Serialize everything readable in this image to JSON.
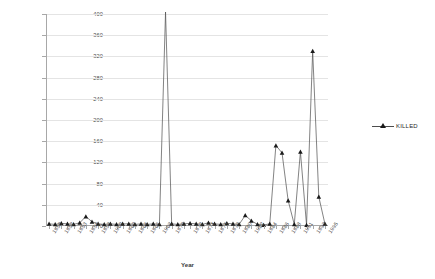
{
  "chart_data": {
    "type": "line",
    "title": "",
    "xlabel": "Year",
    "ylabel": "Killed",
    "ylim": [
      0,
      400
    ],
    "ytick_step": 40,
    "yticks": [
      0,
      40,
      80,
      120,
      160,
      200,
      240,
      280,
      320,
      360,
      400
    ],
    "grid": true,
    "legend_position": "right",
    "clipped_note": "value at 1969 exceeds axis maximum and is drawn clipped at 400",
    "series": [
      {
        "name": "KILLED",
        "marker": "triangle",
        "color": "#1a1a1a",
        "line_color": "#4d4d4d",
        "x": [
          1950,
          1951,
          1952,
          1953,
          1954,
          1955,
          1956,
          1957,
          1958,
          1959,
          1960,
          1961,
          1962,
          1963,
          1964,
          1965,
          1966,
          1967,
          1968,
          1969,
          1970,
          1971,
          1972,
          1973,
          1974,
          1975,
          1976,
          1977,
          1978,
          1979,
          1980,
          1981,
          1982,
          1983,
          1984,
          1985,
          1986,
          1987,
          1988,
          1989,
          1990,
          1991,
          1992,
          1993,
          1994,
          1995
        ],
        "values": [
          4,
          3,
          5,
          4,
          3,
          6,
          18,
          8,
          4,
          3,
          4,
          3,
          4,
          4,
          3,
          4,
          3,
          4,
          3,
          440,
          4,
          3,
          4,
          5,
          4,
          3,
          6,
          4,
          3,
          5,
          4,
          3,
          20,
          10,
          3,
          2,
          4,
          152,
          138,
          48,
          3,
          140,
          2,
          330,
          55,
          4
        ]
      }
    ],
    "xtick_labels": [
      "1950",
      "1952",
      "1953",
      "1956",
      "1958",
      "1960",
      "1962",
      "1964",
      "1966",
      "1968",
      "1970",
      "1972",
      "1974",
      "1976",
      "1978",
      "1980",
      "1982",
      "1984",
      "1986",
      "1988",
      "1991",
      "1993",
      "1995"
    ]
  },
  "legend": {
    "entries": [
      {
        "label": "KILLED"
      }
    ]
  }
}
